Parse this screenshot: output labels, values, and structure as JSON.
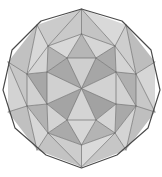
{
  "figure": {
    "title": "Geodesic polyhedron wireframe",
    "shape_name": "triangulated-decagon-polyhedron",
    "background_color": "#ffffff",
    "width": 162,
    "height": 177,
    "center": {
      "x": 81.5,
      "y": 88.5
    },
    "palette": {
      "light": "#d8d8d8",
      "light_alt": "#cfcfcf",
      "mid": "#c2c2c2",
      "mid_alt": "#b8b8b8",
      "dark": "#a8a8a8",
      "dark_alt": "#9e9e9e",
      "darkest": "#929292",
      "edge_stroke": "#6e6e6e",
      "silhouette_stroke": "#4a4a4a"
    },
    "outline": {
      "name": "decagon-silhouette",
      "sides": 10,
      "points": "81.5,9 122,21 151,50 160,90 148,128 117,155 81.5,168 46,155 15,128 3,90 12,50 41,21"
    },
    "ring_outer": [
      {
        "id": "o0",
        "x": 81.5,
        "y": 9
      },
      {
        "id": "o1",
        "x": 126,
        "y": 25
      },
      {
        "id": "o2",
        "x": 155,
        "y": 62
      },
      {
        "id": "o3",
        "x": 155,
        "y": 112
      },
      {
        "id": "o4",
        "x": 126,
        "y": 150
      },
      {
        "id": "o5",
        "x": 81.5,
        "y": 167
      },
      {
        "id": "o6",
        "x": 37,
        "y": 150
      },
      {
        "id": "o7",
        "x": 8,
        "y": 112
      },
      {
        "id": "o8",
        "x": 8,
        "y": 62
      },
      {
        "id": "o9",
        "x": 37,
        "y": 25
      }
    ],
    "ring_middle": [
      {
        "id": "m0",
        "x": 81.5,
        "y": 34
      },
      {
        "id": "m1",
        "x": 115,
        "y": 46
      },
      {
        "id": "m2",
        "x": 136,
        "y": 74
      },
      {
        "id": "m3",
        "x": 136,
        "y": 106
      },
      {
        "id": "m4",
        "x": 115,
        "y": 133
      },
      {
        "id": "m5",
        "x": 81.5,
        "y": 145
      },
      {
        "id": "m6",
        "x": 48,
        "y": 133
      },
      {
        "id": "m7",
        "x": 27,
        "y": 106
      },
      {
        "id": "m8",
        "x": 27,
        "y": 74
      },
      {
        "id": "m9",
        "x": 48,
        "y": 46
      }
    ],
    "ring_inner": [
      {
        "id": "i0",
        "x": 81.5,
        "y": 56
      },
      {
        "id": "i1",
        "x": 105,
        "y": 68
      },
      {
        "id": "i2",
        "x": 110,
        "y": 95
      },
      {
        "id": "i3",
        "x": 81.5,
        "y": 118
      },
      {
        "id": "i4",
        "x": 53,
        "y": 95
      },
      {
        "id": "i5",
        "x": 58,
        "y": 68
      }
    ],
    "faces": [
      {
        "name": "face-center-n",
        "fill": "#cfcfcf",
        "points": "81.5,88.5 67,58 96,58"
      },
      {
        "name": "face-center-ne",
        "fill": "#a6a6a6",
        "points": "81.5,88.5 96,58 116,72"
      },
      {
        "name": "face-center-e",
        "fill": "#d2d2d2",
        "points": "81.5,88.5 116,72 116,104"
      },
      {
        "name": "face-center-se",
        "fill": "#a2a2a2",
        "points": "81.5,88.5 116,104 96,120"
      },
      {
        "name": "face-center-s",
        "fill": "#d4d4d4",
        "points": "81.5,88.5 96,120 67,120"
      },
      {
        "name": "face-center-sw",
        "fill": "#a4a4a4",
        "points": "81.5,88.5 67,120 47,104"
      },
      {
        "name": "face-center-w",
        "fill": "#d0d0d0",
        "points": "81.5,88.5 47,104 47,72"
      },
      {
        "name": "face-center-nw",
        "fill": "#a8a8a8",
        "points": "81.5,88.5 47,72 67,58"
      },
      {
        "name": "face-ring-n-left",
        "fill": "#b6b6b6",
        "points": "67,58 96,58 81.5,34"
      },
      {
        "name": "face-ring-n-up",
        "fill": "#d6d6d6",
        "points": "81.5,34 96,58 115,46"
      },
      {
        "name": "face-ring-ne-a",
        "fill": "#ababab",
        "points": "96,58 115,46 116,72"
      },
      {
        "name": "face-ring-ne-b",
        "fill": "#d4d4d4",
        "points": "115,46 116,72 136,74"
      },
      {
        "name": "face-ring-e-a",
        "fill": "#b0b0b0",
        "points": "116,72 136,74 136,106"
      },
      {
        "name": "face-ring-e-b",
        "fill": "#d2d2d2",
        "points": "116,72 136,106 116,104"
      },
      {
        "name": "face-ring-se-a",
        "fill": "#a9a9a9",
        "points": "116,104 136,106 115,133"
      },
      {
        "name": "face-ring-se-b",
        "fill": "#d5d5d5",
        "points": "116,104 115,133 96,120"
      },
      {
        "name": "face-ring-s-a",
        "fill": "#b4b4b4",
        "points": "96,120 115,133 81.5,145"
      },
      {
        "name": "face-ring-s-b",
        "fill": "#d7d7d7",
        "points": "96,120 81.5,145 67,120"
      },
      {
        "name": "face-ring-sw-a",
        "fill": "#aaaaaa",
        "points": "67,120 81.5,145 48,133"
      },
      {
        "name": "face-ring-sw-b",
        "fill": "#d3d3d3",
        "points": "67,120 48,133 47,104"
      },
      {
        "name": "face-ring-w-a",
        "fill": "#b2b2b2",
        "points": "47,104 48,133 27,106"
      },
      {
        "name": "face-ring-w-b",
        "fill": "#d1d1d1",
        "points": "47,104 27,106 27,74"
      },
      {
        "name": "face-ring-nw-a",
        "fill": "#a7a7a7",
        "points": "47,72 47,104 27,74"
      },
      {
        "name": "face-ring-nw-b",
        "fill": "#d5d5d5",
        "points": "47,72 27,74 48,46"
      },
      {
        "name": "face-ring-nn-a",
        "fill": "#b3b3b3",
        "points": "67,58 47,72 48,46"
      },
      {
        "name": "face-ring-nn-b",
        "fill": "#d8d8d8",
        "points": "67,58 48,46 81.5,34"
      },
      {
        "name": "face-outer-n-l",
        "fill": "#c9c9c9",
        "points": "81.5,34 48,46 81.5,9"
      },
      {
        "name": "face-outer-n-r",
        "fill": "#c4c4c4",
        "points": "81.5,34 81.5,9 115,46"
      },
      {
        "name": "face-outer-ne-l",
        "fill": "#d9d9d9",
        "points": "115,46 81.5,9 126,25"
      },
      {
        "name": "face-outer-ne-r",
        "fill": "#cecece",
        "points": "115,46 126,25 136,74"
      },
      {
        "name": "face-outer-ene",
        "fill": "#bdbdbd",
        "points": "136,74 126,25 155,62"
      },
      {
        "name": "face-outer-e-u",
        "fill": "#d6d6d6",
        "points": "136,74 155,62 155,112"
      },
      {
        "name": "face-outer-e-d",
        "fill": "#c8c8c8",
        "points": "136,74 155,112 136,106"
      },
      {
        "name": "face-outer-ese",
        "fill": "#bfbfbf",
        "points": "136,106 155,112 126,150"
      },
      {
        "name": "face-outer-se-u",
        "fill": "#d4d4d4",
        "points": "136,106 126,150 115,133"
      },
      {
        "name": "face-outer-se-d",
        "fill": "#c6c6c6",
        "points": "115,133 126,150 81.5,167"
      },
      {
        "name": "face-outer-s-r",
        "fill": "#dadada",
        "points": "115,133 81.5,167 81.5,145"
      },
      {
        "name": "face-outer-s-l",
        "fill": "#cdcdcd",
        "points": "81.5,145 81.5,167 48,133"
      },
      {
        "name": "face-outer-sw-d",
        "fill": "#c3c3c3",
        "points": "48,133 81.5,167 37,150"
      },
      {
        "name": "face-outer-sw-u",
        "fill": "#d7d7d7",
        "points": "48,133 37,150 27,106"
      },
      {
        "name": "face-outer-wsw",
        "fill": "#c0c0c0",
        "points": "27,106 37,150 8,112"
      },
      {
        "name": "face-outer-w-d",
        "fill": "#d3d3d3",
        "points": "27,106 8,112 8,62"
      },
      {
        "name": "face-outer-w-u",
        "fill": "#c7c7c7",
        "points": "27,106 8,62 27,74"
      },
      {
        "name": "face-outer-wnw",
        "fill": "#c1c1c1",
        "points": "27,74 8,62 37,25"
      },
      {
        "name": "face-outer-nw-d",
        "fill": "#d8d8d8",
        "points": "27,74 37,25 48,46"
      },
      {
        "name": "face-outer-nw-u",
        "fill": "#cbcbcb",
        "points": "48,46 37,25 81.5,9"
      }
    ],
    "edges": [
      {
        "name": "edge-ring-inner",
        "points": "67,58 96,58 116,72 116,104 96,120 67,120 47,104 47,72 67,58"
      },
      {
        "name": "edge-ring-middle",
        "points": "81.5,34 115,46 136,74 136,106 115,133 81.5,145 48,133 27,106 27,74 48,46 81.5,34"
      },
      {
        "name": "edge-spoke-n",
        "points": "81.5,88.5 67,58"
      },
      {
        "name": "edge-spoke-n2",
        "points": "81.5,88.5 96,58"
      },
      {
        "name": "edge-spoke-ne",
        "points": "81.5,88.5 116,72"
      },
      {
        "name": "edge-spoke-e",
        "points": "81.5,88.5 116,104"
      },
      {
        "name": "edge-spoke-se",
        "points": "81.5,88.5 96,120"
      },
      {
        "name": "edge-spoke-s",
        "points": "81.5,88.5 67,120"
      },
      {
        "name": "edge-spoke-sw",
        "points": "81.5,88.5 47,104"
      },
      {
        "name": "edge-spoke-w",
        "points": "81.5,88.5 47,72"
      },
      {
        "name": "edge-link-n-a",
        "points": "81.5,34 67,58"
      },
      {
        "name": "edge-link-n-b",
        "points": "81.5,34 96,58"
      },
      {
        "name": "edge-link-ne-a",
        "points": "115,46 96,58"
      },
      {
        "name": "edge-link-ne-b",
        "points": "115,46 116,72"
      },
      {
        "name": "edge-link-e-a",
        "points": "136,74 116,72"
      },
      {
        "name": "edge-link-e-b",
        "points": "136,106 116,104"
      },
      {
        "name": "edge-link-se-a",
        "points": "115,133 116,104"
      },
      {
        "name": "edge-link-se-b",
        "points": "115,133 96,120"
      },
      {
        "name": "edge-link-s-a",
        "points": "81.5,145 96,120"
      },
      {
        "name": "edge-link-s-b",
        "points": "81.5,145 67,120"
      },
      {
        "name": "edge-link-sw-a",
        "points": "48,133 67,120"
      },
      {
        "name": "edge-link-sw-b",
        "points": "48,133 47,104"
      },
      {
        "name": "edge-link-w-a",
        "points": "27,106 47,104"
      },
      {
        "name": "edge-link-w-b",
        "points": "27,74 47,72"
      },
      {
        "name": "edge-link-nw-a",
        "points": "48,46 47,72"
      },
      {
        "name": "edge-link-nw-b",
        "points": "48,46 67,58"
      },
      {
        "name": "edge-cross-e-diag",
        "points": "116,72 136,106"
      },
      {
        "name": "edge-cross-w-diag",
        "points": "47,104 27,74"
      },
      {
        "name": "edge-outer-n-a",
        "points": "81.5,9 81.5,34"
      },
      {
        "name": "edge-outer-n-l",
        "points": "81.5,9 48,46"
      },
      {
        "name": "edge-outer-n-r",
        "points": "81.5,9 115,46"
      },
      {
        "name": "edge-outer-ne-c",
        "points": "126,25 115,46"
      },
      {
        "name": "edge-outer-ne-d",
        "points": "126,25 136,74"
      },
      {
        "name": "edge-outer-e-c",
        "points": "155,62 136,74"
      },
      {
        "name": "edge-outer-e-d",
        "points": "155,112 136,106"
      },
      {
        "name": "edge-outer-e-x",
        "points": "155,112 136,74"
      },
      {
        "name": "edge-outer-se-c",
        "points": "126,150 136,106"
      },
      {
        "name": "edge-outer-se-d",
        "points": "126,150 115,133"
      },
      {
        "name": "edge-outer-s-a",
        "points": "81.5,167 81.5,145"
      },
      {
        "name": "edge-outer-s-l",
        "points": "81.5,167 48,133"
      },
      {
        "name": "edge-outer-s-r",
        "points": "81.5,167 115,133"
      },
      {
        "name": "edge-outer-sw-c",
        "points": "37,150 48,133"
      },
      {
        "name": "edge-outer-sw-d",
        "points": "37,150 27,106"
      },
      {
        "name": "edge-outer-w-c",
        "points": "8,112 27,106"
      },
      {
        "name": "edge-outer-w-d",
        "points": "8,62 27,74"
      },
      {
        "name": "edge-outer-w-x",
        "points": "8,62 27,106"
      },
      {
        "name": "edge-outer-nw-c",
        "points": "37,25 27,74"
      },
      {
        "name": "edge-outer-nw-d",
        "points": "37,25 48,46"
      }
    ]
  }
}
